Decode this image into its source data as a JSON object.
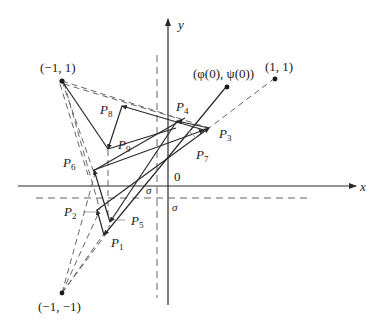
{
  "diagram": {
    "axes": {
      "x_label": "x",
      "y_label": "y",
      "origin_label": "0"
    },
    "points": {
      "top_left": {
        "label": "(−1, 1)"
      },
      "top_right": {
        "label": "(1, 1)"
      },
      "bottom_left": {
        "label": "(−1, −1)"
      },
      "start": {
        "label": "(φ(0), ψ(0))"
      }
    },
    "sigma_labels": {
      "sigma_left": "σ",
      "sigma_right": "σ"
    },
    "iterates": [
      {
        "name": "P",
        "sub": "1"
      },
      {
        "name": "P",
        "sub": "2"
      },
      {
        "name": "P",
        "sub": "3"
      },
      {
        "name": "P",
        "sub": "4"
      },
      {
        "name": "P",
        "sub": "5"
      },
      {
        "name": "P",
        "sub": "6"
      },
      {
        "name": "P",
        "sub": "7"
      },
      {
        "name": "P",
        "sub": "8"
      },
      {
        "name": "P",
        "sub": "9"
      }
    ],
    "colors": {
      "line": "#2a2a2a",
      "dashed": "#555555",
      "background": "#ffffff"
    }
  }
}
